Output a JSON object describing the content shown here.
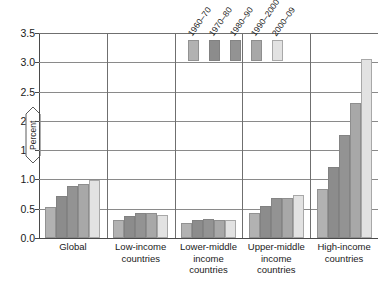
{
  "chart_data": {
    "type": "bar",
    "title": "",
    "xlabel": "",
    "ylabel": "Percent",
    "ylim": [
      0.0,
      3.5
    ],
    "ytick_labels": [
      "3.5",
      "3.0",
      "2.5",
      "2.0",
      "1.5",
      "1.0",
      "0.5",
      "0.0"
    ],
    "ytick_values": [
      3.5,
      3.0,
      2.5,
      2.0,
      1.5,
      1.0,
      0.5,
      0.0
    ],
    "grid": true,
    "legend_position": "top-center-inside",
    "categories": [
      "Global",
      "Low-income countries",
      "Lower-middle income countries",
      "Upper-middle income countries",
      "High-income countries"
    ],
    "category_lines": [
      [
        "Global"
      ],
      [
        "Low-income",
        "countries"
      ],
      [
        "Lower-middle",
        "income",
        "countries"
      ],
      [
        "Upper-middle",
        "income",
        "countries"
      ],
      [
        "High-income",
        "countries"
      ]
    ],
    "series": [
      {
        "name": "1960–70",
        "color": "#b2b2b2",
        "values": [
          0.53,
          0.3,
          0.25,
          0.43,
          0.83
        ]
      },
      {
        "name": "1970–80",
        "color": "#8c8c8c",
        "values": [
          0.72,
          0.38,
          0.3,
          0.54,
          1.22
        ]
      },
      {
        "name": "1980–90",
        "color": "#939393",
        "values": [
          0.89,
          0.43,
          0.33,
          0.68,
          1.76
        ]
      },
      {
        "name": "1990–2000",
        "color": "#a8a8a8",
        "values": [
          0.92,
          0.43,
          0.3,
          0.68,
          2.31
        ]
      },
      {
        "name": "2000–09",
        "color": "#e2e2e2",
        "values": [
          0.99,
          0.4,
          0.3,
          0.73,
          3.05
        ]
      }
    ]
  },
  "axis": {
    "line_color": "#4a4a4a",
    "grid_color": "#6f6f6f"
  }
}
